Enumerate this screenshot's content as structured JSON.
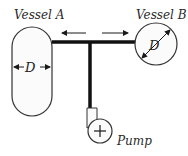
{
  "diagram": {
    "vessel_a": {
      "label": "Vessel A",
      "dimension": "D"
    },
    "vessel_b": {
      "label": "Vessel B",
      "dimension": "D"
    },
    "pump": {
      "label": "Pump",
      "symbol": "+"
    },
    "flow_arrows": [
      "left-arrow",
      "right-arrow"
    ],
    "colors": {
      "line": "#1a1a1a",
      "vessel_outline": "#333333",
      "background": "#ffffff"
    }
  }
}
